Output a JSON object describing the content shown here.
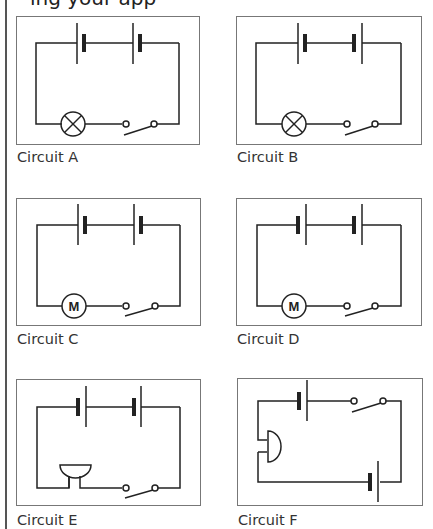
{
  "page": {
    "clipped_heading": "ing your app"
  },
  "circuits": [
    {
      "id": "A",
      "label": "Circuit A",
      "component": "lamp",
      "batteries": "series, both cells same orientation (long plate left)",
      "switch": "open"
    },
    {
      "id": "B",
      "label": "Circuit B",
      "component": "lamp",
      "batteries": "series, cells facing each other (opposed)",
      "switch": "open"
    },
    {
      "id": "C",
      "label": "Circuit C",
      "component": "motor",
      "component_text": "M",
      "batteries": "series, both cells same orientation (long plate left)",
      "switch": "open"
    },
    {
      "id": "D",
      "label": "Circuit D",
      "component": "motor",
      "component_text": "M",
      "batteries": "series, both cells same orientation (short plate left)",
      "switch": "open"
    },
    {
      "id": "E",
      "label": "Circuit E",
      "component": "buzzer",
      "batteries": "series, both cells same orientation (short plate left)",
      "switch": "open"
    },
    {
      "id": "F",
      "label": "Circuit F",
      "component": "buzzer",
      "batteries": "two separate cells on opposite sides of loop",
      "switch": "open"
    }
  ],
  "colors": {
    "wire": "#222222",
    "frame": "#777777",
    "label": "#333333"
  }
}
